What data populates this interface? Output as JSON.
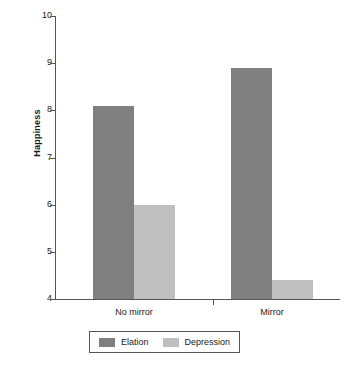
{
  "chart_data": {
    "type": "bar",
    "title": "",
    "xlabel": "",
    "ylabel": "Happiness",
    "categories": [
      "No mirror",
      "Mirror"
    ],
    "series": [
      {
        "name": "Elation",
        "values": [
          8.1,
          8.9
        ],
        "color": "#808080"
      },
      {
        "name": "Depression",
        "values": [
          6.0,
          4.4
        ],
        "color": "#bfbfbf"
      }
    ],
    "ylim": [
      4,
      10
    ],
    "yticks": [
      4,
      5,
      6,
      7,
      8,
      9,
      10
    ],
    "ytick_labels": [
      "4",
      "5",
      "6",
      "7",
      "8",
      "9",
      "10"
    ],
    "grid": false,
    "legend_position": "bottom",
    "legend_entries": [
      "Elation",
      "Depression"
    ]
  },
  "axis": {
    "y_title": "Happiness",
    "ticks": [
      "10",
      "9",
      "8",
      "7",
      "6",
      "5",
      "4"
    ]
  },
  "categories": [
    {
      "label": "No mirror"
    },
    {
      "label": "Mirror"
    }
  ],
  "legend": {
    "items": [
      {
        "label": "Elation"
      },
      {
        "label": "Depression"
      }
    ]
  }
}
